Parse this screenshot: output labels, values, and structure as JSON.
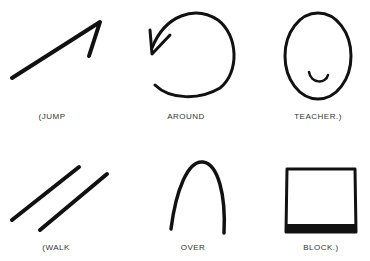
{
  "diagram": {
    "stroke_color": "#111111",
    "rows": [
      {
        "sentence": "(JUMP AROUND TEACHER.)",
        "items": [
          {
            "id": "jump",
            "symbol": "diagonal-arrow-with-hook",
            "label": "(JUMP"
          },
          {
            "id": "around",
            "symbol": "circular-arrow",
            "label": "AROUND"
          },
          {
            "id": "teacher",
            "symbol": "oval-face-with-smile",
            "label": "TEACHER.)"
          }
        ]
      },
      {
        "sentence": "(WALK OVER BLOCK.)",
        "items": [
          {
            "id": "walk",
            "symbol": "two-parallel-diagonal-lines",
            "label": "(WALK"
          },
          {
            "id": "over",
            "symbol": "arch",
            "label": "OVER"
          },
          {
            "id": "block",
            "symbol": "rectangle-thick-bottom",
            "label": "BLOCK.)"
          }
        ]
      }
    ]
  }
}
